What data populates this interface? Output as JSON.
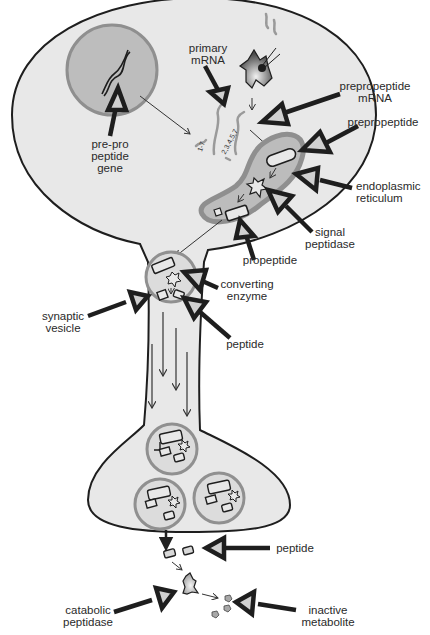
{
  "diagram": {
    "type": "neuropeptide biosynthesis pathway",
    "colors": {
      "cell_fill": "#e8e8e8",
      "outline": "#1e1e1e",
      "nucleus_fill": "#bdbdbd",
      "nucleus_ring": "#8f8f8f",
      "er_fill": "#bcbcbc",
      "er_ring": "#8f8f8f",
      "vesicle_ring": "#909090",
      "arrow_head_fill": "#d0d0d0"
    },
    "labels": {
      "gene": "pre-pro\npeptide\ngene",
      "primary_mrna": "primary\nmRNA",
      "prepropeptide_mrna": "prepropeptide\nmRNA",
      "prepropeptide": "prepropeptide",
      "endoplasmic_reticulum": "endoplasmic\nreticulum",
      "signal_peptidase": "signal\npeptidase",
      "propeptide": "propeptide",
      "converting_enzyme": "converting\nenzyme",
      "synaptic_vesicle": "synaptic\nvesicle",
      "peptide_axon": "peptide",
      "peptide_released": "peptide",
      "catabolic_peptidase": "catabolic\npeptidase",
      "inactive_metabolite": "inactive\nmetabolite"
    },
    "exon_labels": {
      "exon_a": "1-7",
      "exon_b": "2,3,4,5,7"
    },
    "nodes": [
      {
        "id": "gene",
        "label": "pre-pro peptide gene"
      },
      {
        "id": "primary_mrna",
        "label": "primary mRNA"
      },
      {
        "id": "prepropeptide_mrna",
        "label": "prepropeptide mRNA"
      },
      {
        "id": "prepropeptide",
        "label": "prepropeptide"
      },
      {
        "id": "er",
        "label": "endoplasmic reticulum"
      },
      {
        "id": "signal_peptidase",
        "label": "signal peptidase"
      },
      {
        "id": "propeptide",
        "label": "propeptide"
      },
      {
        "id": "converting_enzyme",
        "label": "converting enzyme"
      },
      {
        "id": "synaptic_vesicle",
        "label": "synaptic vesicle"
      },
      {
        "id": "peptide",
        "label": "peptide"
      },
      {
        "id": "catabolic_peptidase",
        "label": "catabolic peptidase"
      },
      {
        "id": "inactive_metabolite",
        "label": "inactive metabolite"
      }
    ],
    "edges": [
      {
        "from": "gene",
        "to": "primary_mrna"
      },
      {
        "from": "primary_mrna",
        "to": "prepropeptide_mrna"
      },
      {
        "from": "prepropeptide_mrna",
        "to": "prepropeptide"
      },
      {
        "from": "prepropeptide",
        "to": "propeptide",
        "via": "signal_peptidase"
      },
      {
        "from": "propeptide",
        "to": "peptide",
        "via": "converting_enzyme"
      },
      {
        "from": "peptide",
        "to": "inactive_metabolite",
        "via": "catabolic_peptidase"
      }
    ]
  }
}
